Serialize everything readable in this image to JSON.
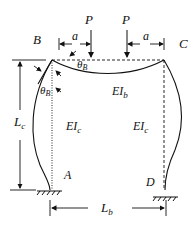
{
  "diagram": {
    "type": "portal-frame-deflection",
    "nodes": {
      "B": "B",
      "C": "C",
      "A": "A",
      "D": "D"
    },
    "loads": [
      {
        "label": "P",
        "offset_label": "a"
      },
      {
        "label": "P",
        "offset_label": "a"
      }
    ],
    "rotation_label": "θ",
    "rotation_sub": "B",
    "beam_stiffness": {
      "main": "EI",
      "sub": "b"
    },
    "column_stiffness": {
      "main": "EI",
      "sub": "c"
    },
    "column_length": {
      "main": "L",
      "sub": "c"
    },
    "beam_length": {
      "main": "L",
      "sub": "b"
    },
    "colors": {
      "line": "#111111",
      "background": "#ffffff"
    }
  }
}
